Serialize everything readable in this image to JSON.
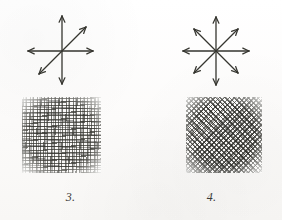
{
  "page": {
    "background_color": "#fdfdfc",
    "ink_color": "#3a3a38",
    "width": 282,
    "height": 220
  },
  "figures": [
    {
      "id": "figure-3",
      "caption": "3.",
      "diagram": {
        "name": "six-direction-arrow-diagram",
        "center": {
          "x": 62,
          "y": 47
        },
        "arrow_count": 6,
        "stroke_color": "#35352f",
        "stroke_width": 1.3,
        "arrows": [
          {
            "name": "arrow-up",
            "angle_deg": 90,
            "length": 35
          },
          {
            "name": "arrow-down",
            "angle_deg": 270,
            "length": 33
          },
          {
            "name": "arrow-left",
            "angle_deg": 180,
            "length": 34
          },
          {
            "name": "arrow-right",
            "angle_deg": 0,
            "length": 31
          },
          {
            "name": "arrow-up-right",
            "angle_deg": 40,
            "length": 30
          },
          {
            "name": "arrow-down-left",
            "angle_deg": 220,
            "length": 30
          }
        ]
      },
      "texture": {
        "name": "orthogonal-woven-texture-swatch",
        "x": 22,
        "y": 97,
        "width": 79,
        "height": 76,
        "pattern": "woven plain-weave crosshatch, dominant horizontal and vertical strokes",
        "dominant_angles_deg": [
          0,
          90
        ],
        "density": "medium",
        "ink_color": "#4a4a46"
      }
    },
    {
      "id": "figure-4",
      "caption": "4.",
      "diagram": {
        "name": "eight-direction-arrow-diagram",
        "center": {
          "x": 216,
          "y": 47
        },
        "arrow_count": 8,
        "stroke_color": "#35352f",
        "stroke_width": 1.3,
        "arrows": [
          {
            "name": "arrow-up",
            "angle_deg": 90,
            "length": 34
          },
          {
            "name": "arrow-down",
            "angle_deg": 270,
            "length": 34
          },
          {
            "name": "arrow-left",
            "angle_deg": 180,
            "length": 33
          },
          {
            "name": "arrow-right",
            "angle_deg": 0,
            "length": 33
          },
          {
            "name": "arrow-up-right",
            "angle_deg": 45,
            "length": 30
          },
          {
            "name": "arrow-up-left",
            "angle_deg": 135,
            "length": 30
          },
          {
            "name": "arrow-down-left",
            "angle_deg": 225,
            "length": 30
          },
          {
            "name": "arrow-down-right",
            "angle_deg": 315,
            "length": 30
          }
        ]
      },
      "texture": {
        "name": "diagonal-crosshatch-texture-swatch",
        "x": 186,
        "y": 97,
        "width": 76,
        "height": 76,
        "pattern": "dense diagonal crosshatch rotated approximately 45 degrees",
        "dominant_angles_deg": [
          45,
          135
        ],
        "density": "high",
        "ink_color": "#45453f"
      }
    }
  ]
}
